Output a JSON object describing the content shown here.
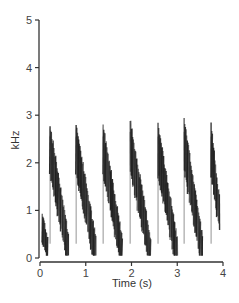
{
  "chart_data": {
    "type": "spectrogram",
    "title": "",
    "xlabel": "Time (s)",
    "ylabel": "kHz",
    "xlim": [
      0,
      4
    ],
    "ylim": [
      0,
      5
    ],
    "xticks": [
      0,
      1,
      2,
      3,
      4
    ],
    "yticks": [
      0,
      1,
      2,
      3,
      4,
      5
    ],
    "grid": false,
    "legend": null,
    "ink_color": "#1e1e1e",
    "notes": [
      {
        "onset_s": 0.05,
        "offset_s": 0.17,
        "f_start_khz": 0.7,
        "f_end_khz": 0.2,
        "shape": "short low blob"
      },
      {
        "onset_s": 0.22,
        "offset_s": 0.62,
        "f_start_khz": 2.4,
        "f_end_khz": 0.25,
        "shape": "descending sweep"
      },
      {
        "onset_s": 0.79,
        "offset_s": 1.22,
        "f_start_khz": 2.4,
        "f_end_khz": 0.15,
        "shape": "descending sweep"
      },
      {
        "onset_s": 1.38,
        "offset_s": 1.8,
        "f_start_khz": 2.4,
        "f_end_khz": 0.15,
        "shape": "descending sweep"
      },
      {
        "onset_s": 1.97,
        "offset_s": 2.42,
        "f_start_khz": 2.5,
        "f_end_khz": 0.15,
        "shape": "descending sweep"
      },
      {
        "onset_s": 2.58,
        "offset_s": 3.0,
        "f_start_khz": 2.4,
        "f_end_khz": 0.15,
        "shape": "descending sweep"
      },
      {
        "onset_s": 3.15,
        "offset_s": 3.55,
        "f_start_khz": 2.5,
        "f_end_khz": 0.2,
        "shape": "descending sweep"
      },
      {
        "onset_s": 3.74,
        "offset_s": 3.92,
        "f_start_khz": 2.4,
        "f_end_khz": 1.0,
        "shape": "partial descending sweep"
      }
    ]
  },
  "axes": {
    "xlabel": "Time (s)",
    "ylabel": "kHz",
    "xtick_labels": [
      "0",
      "1",
      "2",
      "3",
      "4"
    ],
    "ytick_labels": [
      "0",
      "1",
      "2",
      "3",
      "4",
      "5"
    ]
  }
}
